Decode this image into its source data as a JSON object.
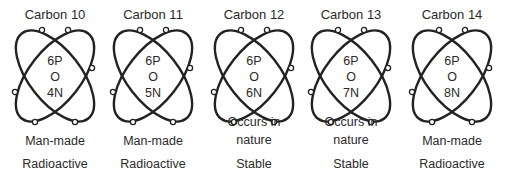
{
  "isotopes": [
    {
      "title": "Carbon 10",
      "protons": "6P",
      "nucleus_symbol": "O",
      "neutrons": "4N",
      "origin_line1": "Man-made",
      "origin_line2": "",
      "stability": "Radioactive",
      "center_x": 55
    },
    {
      "title": "Carbon 11",
      "protons": "6P",
      "nucleus_symbol": "O",
      "neutrons": "5N",
      "origin_line1": "Man-made",
      "origin_line2": "",
      "stability": "Radioactive",
      "center_x": 153
    },
    {
      "title": "Carbon 12",
      "protons": "6P",
      "nucleus_symbol": "O",
      "neutrons": "6N",
      "origin_line1": "Occurs in",
      "origin_line2": "nature",
      "stability": "Stable",
      "center_x": 254
    },
    {
      "title": "Carbon 13",
      "protons": "6P",
      "nucleus_symbol": "O",
      "neutrons": "7N",
      "origin_line1": "Occurs in",
      "origin_line2": "nature",
      "stability": "Stable",
      "center_x": 351
    },
    {
      "title": "Carbon 14",
      "protons": "6P",
      "nucleus_symbol": "O",
      "neutrons": "8N",
      "origin_line1": "Man-made",
      "origin_line2": "",
      "stability": "Radioactive",
      "center_x": 452
    }
  ],
  "colors": {
    "stroke": "#222222",
    "text": "#2a2a2a",
    "background": "#ffffff"
  }
}
